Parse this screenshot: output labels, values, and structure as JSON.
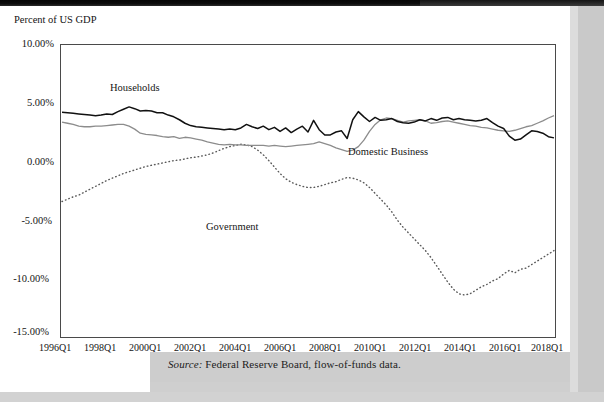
{
  "figure": {
    "y_axis_title": "Percent of US GDP",
    "source_label": "Source:",
    "source_text": " Federal Reserve Board, flow-of-funds data."
  },
  "annotations": {
    "households": "Households",
    "domestic_business": "Domestic Business",
    "government": "Government"
  },
  "chart_data": {
    "type": "line",
    "title": "",
    "subtitle": "",
    "xlabel": "",
    "ylabel": "Percent of US GDP",
    "ylim": [
      -15.0,
      10.0
    ],
    "xlim": [
      "1996Q1",
      "2018Q1"
    ],
    "grid": false,
    "legend_position": "inline-annotations",
    "ytick_labels": [
      "10.00%",
      "5.00%",
      "0.00%",
      "-5.00%",
      "-10.00%",
      "-15.00%"
    ],
    "ytick_values": [
      10,
      5,
      0,
      -5,
      -10,
      -15
    ],
    "xtick_labels": [
      "1996Q1",
      "1998Q1",
      "2000Q1",
      "2002Q1",
      "2004Q1",
      "2006Q1",
      "2008Q1",
      "2010Q1",
      "2012Q1",
      "2014Q1",
      "2016Q1",
      "2018Q1"
    ],
    "xtick_values": [
      0,
      8,
      16,
      24,
      32,
      40,
      48,
      56,
      64,
      72,
      80,
      88
    ],
    "x_quarters": [
      "1996Q1",
      "1996Q2",
      "1996Q3",
      "1996Q4",
      "1997Q1",
      "1997Q2",
      "1997Q3",
      "1997Q4",
      "1998Q1",
      "1998Q2",
      "1998Q3",
      "1998Q4",
      "1999Q1",
      "1999Q2",
      "1999Q3",
      "1999Q4",
      "2000Q1",
      "2000Q2",
      "2000Q3",
      "2000Q4",
      "2001Q1",
      "2001Q2",
      "2001Q3",
      "2001Q4",
      "2002Q1",
      "2002Q2",
      "2002Q3",
      "2002Q4",
      "2003Q1",
      "2003Q2",
      "2003Q3",
      "2003Q4",
      "2004Q1",
      "2004Q2",
      "2004Q3",
      "2004Q4",
      "2005Q1",
      "2005Q2",
      "2005Q3",
      "2005Q4",
      "2006Q1",
      "2006Q2",
      "2006Q3",
      "2006Q4",
      "2007Q1",
      "2007Q2",
      "2007Q3",
      "2007Q4",
      "2008Q1",
      "2008Q2",
      "2008Q3",
      "2008Q4",
      "2009Q1",
      "2009Q2",
      "2009Q3",
      "2009Q4",
      "2010Q1",
      "2010Q2",
      "2010Q3",
      "2010Q4",
      "2011Q1",
      "2011Q2",
      "2011Q3",
      "2011Q4",
      "2012Q1",
      "2012Q2",
      "2012Q3",
      "2012Q4",
      "2013Q1",
      "2013Q2",
      "2013Q3",
      "2013Q4",
      "2014Q1",
      "2014Q2",
      "2014Q3",
      "2014Q4",
      "2015Q1",
      "2015Q2",
      "2015Q3",
      "2015Q4",
      "2016Q1",
      "2016Q2",
      "2016Q3",
      "2016Q4",
      "2017Q1",
      "2017Q2",
      "2017Q3",
      "2017Q4",
      "2018Q1"
    ],
    "series": [
      {
        "name": "Households",
        "style": "solid",
        "color": "#111111",
        "width": 1.5,
        "values": [
          4.25,
          4.2,
          4.15,
          4.1,
          4.05,
          4.0,
          3.95,
          4.0,
          4.1,
          4.05,
          4.3,
          4.5,
          4.7,
          4.55,
          4.35,
          4.4,
          4.35,
          4.2,
          4.2,
          4.0,
          3.85,
          3.6,
          3.3,
          3.1,
          3.0,
          2.95,
          2.9,
          2.85,
          2.8,
          2.75,
          2.8,
          2.75,
          2.9,
          3.2,
          3.0,
          2.85,
          3.05,
          2.75,
          2.95,
          2.6,
          2.9,
          2.5,
          2.8,
          3.05,
          2.55,
          3.55,
          2.75,
          2.3,
          2.3,
          2.55,
          2.65,
          2.0,
          3.6,
          4.3,
          3.85,
          3.45,
          3.8,
          3.55,
          3.6,
          3.7,
          3.45,
          3.35,
          3.3,
          3.4,
          3.6,
          3.5,
          3.7,
          3.55,
          3.75,
          3.8,
          3.6,
          3.7,
          3.6,
          3.55,
          3.5,
          3.55,
          3.7,
          3.35,
          3.05,
          2.85,
          2.2,
          1.85,
          1.95,
          2.3,
          2.65,
          2.6,
          2.45,
          2.15,
          2.05
        ]
      },
      {
        "name": "Domestic Business",
        "style": "solid",
        "color": "#8c8c8c",
        "width": 1.3,
        "values": [
          3.4,
          3.3,
          3.2,
          3.05,
          3.0,
          3.0,
          3.05,
          3.05,
          3.1,
          3.15,
          3.2,
          3.2,
          3.05,
          2.8,
          2.45,
          2.35,
          2.3,
          2.25,
          2.15,
          2.1,
          2.15,
          2.0,
          2.1,
          2.05,
          1.95,
          1.85,
          1.7,
          1.6,
          1.5,
          1.45,
          1.5,
          1.45,
          1.45,
          1.4,
          1.4,
          1.4,
          1.4,
          1.35,
          1.4,
          1.35,
          1.3,
          1.35,
          1.4,
          1.45,
          1.5,
          1.55,
          1.7,
          1.55,
          1.4,
          1.2,
          1.05,
          0.9,
          1.0,
          1.3,
          1.85,
          2.6,
          3.2,
          3.6,
          3.75,
          3.7,
          3.55,
          3.4,
          3.5,
          3.55,
          3.6,
          3.5,
          3.3,
          3.35,
          3.45,
          3.5,
          3.4,
          3.3,
          3.2,
          3.1,
          3.05,
          2.95,
          2.9,
          2.8,
          2.7,
          2.65,
          2.6,
          2.7,
          2.85,
          3.0,
          3.1,
          3.3,
          3.5,
          3.75,
          3.95
        ]
      },
      {
        "name": "Government",
        "style": "dotted",
        "color": "#5a5a5a",
        "width": 1.4,
        "values": [
          -3.4,
          -3.2,
          -3.0,
          -2.85,
          -2.6,
          -2.35,
          -2.1,
          -1.85,
          -1.6,
          -1.4,
          -1.2,
          -1.0,
          -0.85,
          -0.7,
          -0.55,
          -0.4,
          -0.3,
          -0.2,
          -0.1,
          0.0,
          0.1,
          0.15,
          0.25,
          0.35,
          0.4,
          0.5,
          0.6,
          0.75,
          0.95,
          1.15,
          1.3,
          1.4,
          1.5,
          1.45,
          1.3,
          1.0,
          0.6,
          0.1,
          -0.45,
          -1.0,
          -1.45,
          -1.75,
          -1.95,
          -2.1,
          -2.2,
          -2.2,
          -2.1,
          -1.95,
          -1.8,
          -1.7,
          -1.5,
          -1.35,
          -1.4,
          -1.55,
          -1.8,
          -2.2,
          -2.7,
          -3.2,
          -3.7,
          -4.3,
          -5.0,
          -5.6,
          -6.1,
          -6.6,
          -7.1,
          -7.6,
          -8.2,
          -8.9,
          -9.6,
          -10.3,
          -10.9,
          -11.3,
          -11.4,
          -11.3,
          -11.0,
          -10.7,
          -10.5,
          -10.2,
          -10.0,
          -9.6,
          -9.3,
          -9.5,
          -9.2,
          -9.1,
          -8.8,
          -8.5,
          -8.2,
          -7.9,
          -7.6
        ]
      }
    ],
    "government_tail": {
      "note": "Government continues from 2013Q1 recovering to about -5% by 2015 then flat near -4.5% to -5.5% through 2018Q1"
    }
  }
}
